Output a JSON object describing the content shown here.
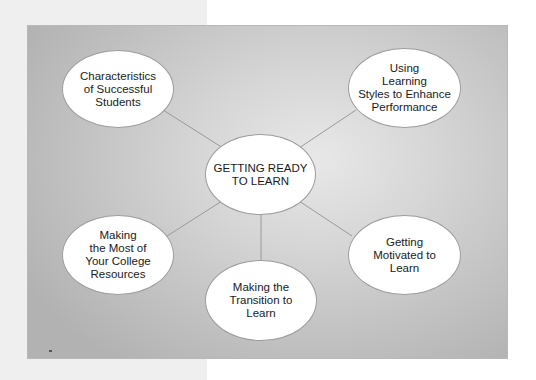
{
  "diagram": {
    "title": "GETTING READY TO LEARN",
    "center": {
      "label": "GETTING READY\nTO LEARN"
    },
    "nodes": [
      {
        "id": "characteristics",
        "label": "Characteristics\nof Successful\nStudents"
      },
      {
        "id": "learning-styles",
        "label": "Using\nLearning\nStyles to Enhance\nPerformance"
      },
      {
        "id": "college-resources",
        "label": "Making\nthe Most of\nYour College\nResources"
      },
      {
        "id": "transition",
        "label": "Making the\nTransition to\nLearn"
      },
      {
        "id": "motivated",
        "label": "Getting\nMotivated to\nLearn"
      }
    ],
    "colors": {
      "node_fill": "#ffffff",
      "node_border": "#9c9c9c",
      "connector": "#9a9a9a",
      "panel_light": "#e8e8e8",
      "panel_dark": "#b2b2b2",
      "left_strip": "#efefef"
    }
  }
}
